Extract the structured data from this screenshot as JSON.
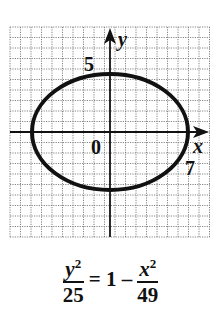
{
  "chart_data": {
    "type": "line",
    "title": "",
    "xlabel": "x",
    "ylabel": "y",
    "origin_label": "0",
    "tick_labels": [
      {
        "axis": "y",
        "value": 5,
        "label": "5"
      },
      {
        "axis": "x",
        "value": 7,
        "label": "7"
      }
    ],
    "grid": true,
    "xlim": [
      -9.5,
      9.5
    ],
    "ylim": [
      -10,
      9.5
    ],
    "series": [
      {
        "name": "ellipse",
        "shape": "ellipse",
        "center": [
          0,
          0
        ],
        "semi_axis_x": 7,
        "semi_axis_y": 5
      }
    ],
    "equation": "y^2/25 = 1 - x^2/49"
  },
  "equation": {
    "lhs_numerator": "y",
    "lhs_exponent": "2",
    "lhs_denominator": "25",
    "middle": "= 1 –",
    "rhs_numerator": "x",
    "rhs_exponent": "2",
    "rhs_denominator": "49"
  },
  "labels": {
    "x_axis": "x",
    "y_axis": "y",
    "origin": "0",
    "y_tick": "5",
    "x_tick": "7"
  }
}
